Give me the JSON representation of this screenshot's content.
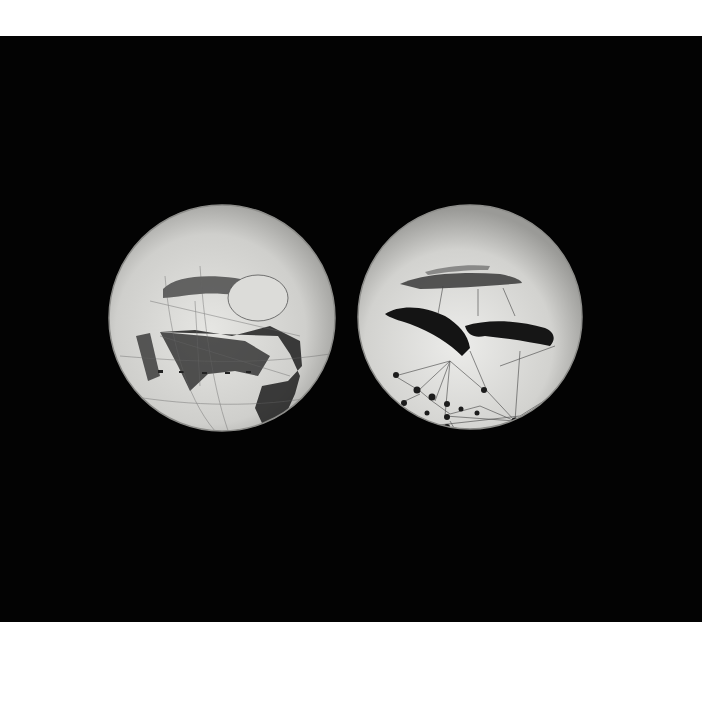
{
  "image": {
    "description": "Black photographic plate showing two hand-drawn globes of Mars with dark markings and canal network",
    "colors": {
      "page_background": "#ffffff",
      "plate_background": "#030303",
      "disc_light": "#d9d9d6",
      "disc_edge": "#9a9a97",
      "marking_dark": "#1a1a1a"
    },
    "globes": [
      {
        "name": "left-globe",
        "cx": 222,
        "cy": 282,
        "r": 113
      },
      {
        "name": "right-globe",
        "cx": 470,
        "cy": 281,
        "r": 112
      }
    ]
  }
}
